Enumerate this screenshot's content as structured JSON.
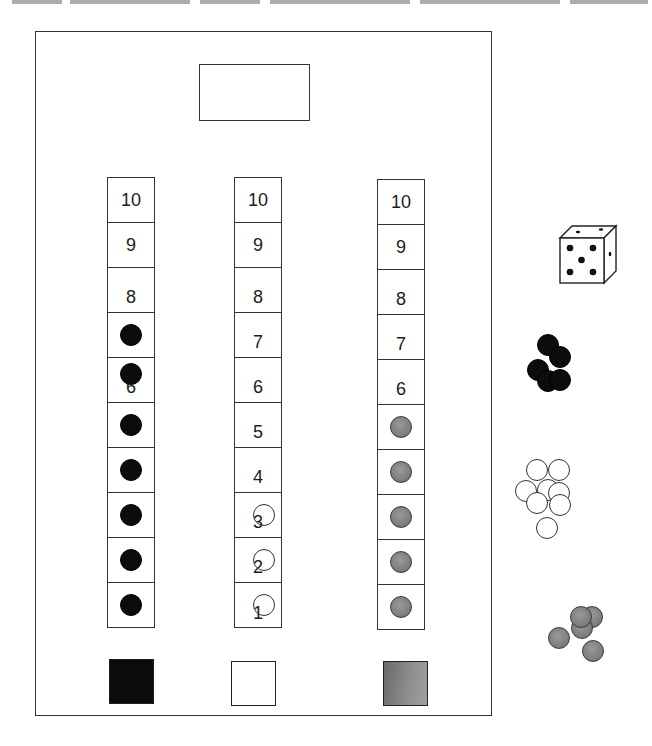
{
  "header": {
    "text_clipped": true,
    "visible_text": ""
  },
  "board": {
    "title_box_label": "",
    "tracks": [
      {
        "id": "black",
        "color": "#0c0c0c",
        "cells": [
          {
            "number": "10",
            "chip": false
          },
          {
            "number": "9",
            "chip": false
          },
          {
            "number": "8",
            "chip": false
          },
          {
            "number": "",
            "chip": true
          },
          {
            "number": "6",
            "chip": true
          },
          {
            "number": "",
            "chip": true
          },
          {
            "number": "",
            "chip": true
          },
          {
            "number": "",
            "chip": true
          },
          {
            "number": "",
            "chip": true
          },
          {
            "number": "",
            "chip": true
          }
        ]
      },
      {
        "id": "white",
        "color": "#ffffff",
        "cells": [
          {
            "number": "10",
            "chip": false
          },
          {
            "number": "9",
            "chip": false
          },
          {
            "number": "8",
            "chip": false
          },
          {
            "number": "7",
            "chip": false
          },
          {
            "number": "6",
            "chip": false
          },
          {
            "number": "5",
            "chip": false
          },
          {
            "number": "4",
            "chip": false
          },
          {
            "number": "3",
            "chip": true
          },
          {
            "number": "2",
            "chip": true
          },
          {
            "number": "1",
            "chip": true
          }
        ]
      },
      {
        "id": "gray",
        "color": "#808080",
        "cells": [
          {
            "number": "10",
            "chip": false
          },
          {
            "number": "9",
            "chip": false
          },
          {
            "number": "8",
            "chip": false
          },
          {
            "number": "7",
            "chip": false
          },
          {
            "number": "6",
            "chip": false
          },
          {
            "number": "",
            "chip": true
          },
          {
            "number": "",
            "chip": true
          },
          {
            "number": "",
            "chip": true
          },
          {
            "number": "",
            "chip": true
          },
          {
            "number": "",
            "chip": true
          }
        ]
      }
    ],
    "swatches": [
      "black",
      "white",
      "gray"
    ]
  },
  "pieces": {
    "die": {
      "face_value": 5,
      "icon": "die-icon"
    },
    "piles": [
      {
        "color": "black",
        "count": 5
      },
      {
        "color": "white",
        "count": 8
      },
      {
        "color": "gray",
        "count": 5
      }
    ]
  },
  "colors": {
    "line": "#333333",
    "black_chip": "#0c0c0c",
    "gray_chip": "#808080",
    "background": "#ffffff"
  }
}
